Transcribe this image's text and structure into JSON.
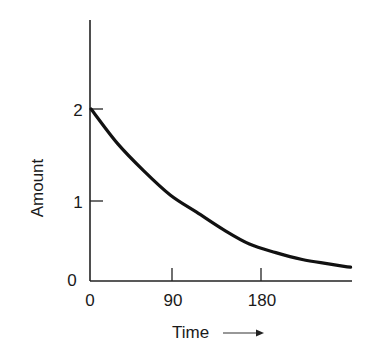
{
  "chart_data": {
    "type": "line",
    "title": "",
    "xlabel": "Time",
    "ylabel": "Amount",
    "x_arrow": true,
    "xticks": [
      0,
      90,
      180
    ],
    "yticks": [
      0,
      1,
      2
    ],
    "xlim": [
      0,
      295
    ],
    "ylim": [
      0,
      3.0
    ],
    "grid": false,
    "legend": null,
    "series": [
      {
        "name": "Amount",
        "color": "#111111",
        "x": [
          0,
          30,
          60,
          90,
          120,
          150,
          180,
          210,
          240,
          270,
          295
        ],
        "y": [
          2.0,
          1.6,
          1.28,
          1.0,
          0.8,
          0.6,
          0.43,
          0.33,
          0.25,
          0.2,
          0.16
        ]
      }
    ]
  },
  "axes": {
    "x_tick_labels": [
      "0",
      "90",
      "180"
    ],
    "y_tick_labels": [
      "0",
      "1",
      "2"
    ],
    "xlabel": "Time",
    "ylabel": "Amount",
    "arrow": "→"
  }
}
